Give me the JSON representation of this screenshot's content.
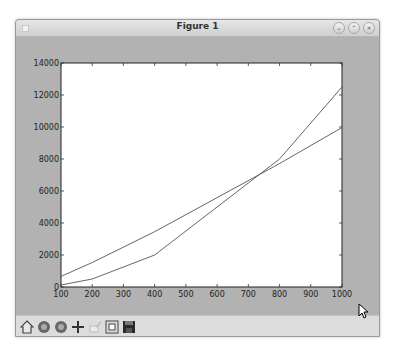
{
  "window": {
    "title": "Figure 1",
    "controls": [
      "minimize",
      "maximize",
      "close"
    ]
  },
  "toolbar": {
    "buttons": [
      {
        "name": "home",
        "icon": "home-icon"
      },
      {
        "name": "back",
        "icon": "back-icon"
      },
      {
        "name": "forward",
        "icon": "forward-icon"
      },
      {
        "name": "pan",
        "icon": "pan-icon"
      },
      {
        "name": "zoom",
        "icon": "zoom-rect-icon"
      },
      {
        "name": "subplots",
        "icon": "subplots-icon"
      },
      {
        "name": "save",
        "icon": "save-icon"
      }
    ]
  },
  "chart_data": {
    "type": "line",
    "title": "",
    "xlabel": "",
    "ylabel": "",
    "x": [
      100,
      200,
      400,
      800,
      1000
    ],
    "series": [
      {
        "name": "series 1 (n log n)",
        "values": [
          664,
          1529,
          3458,
          7715,
          9966
        ],
        "color": "#555555"
      },
      {
        "name": "series 2 (quadratic)",
        "values": [
          125,
          500,
          2000,
          8000,
          12500
        ],
        "color": "#555555"
      }
    ],
    "xlim": [
      100,
      1000
    ],
    "ylim": [
      0,
      14000
    ],
    "xticks": [
      100,
      200,
      300,
      400,
      500,
      600,
      700,
      800,
      900,
      1000
    ],
    "yticks": [
      0,
      2000,
      4000,
      6000,
      8000,
      10000,
      12000,
      14000
    ],
    "grid": false,
    "legend": null
  }
}
